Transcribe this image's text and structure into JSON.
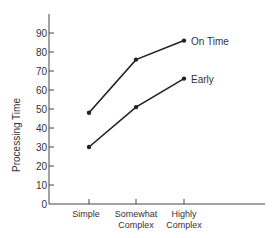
{
  "chart_data": {
    "type": "line",
    "title": "",
    "xlabel": "",
    "ylabel": "Processing Time",
    "categories": [
      "Simple",
      "Somewhat Complex",
      "Highly Complex"
    ],
    "category_lines": [
      [
        "Simple"
      ],
      [
        "Somewhat",
        "Complex"
      ],
      [
        "Highly",
        "Complex"
      ]
    ],
    "series": [
      {
        "name": "On Time",
        "values": [
          48,
          76,
          86
        ]
      },
      {
        "name": "Early",
        "values": [
          30,
          51,
          66
        ]
      }
    ],
    "ylim": [
      0,
      100
    ],
    "yticks": [
      0,
      10,
      20,
      30,
      40,
      50,
      60,
      70,
      80,
      90
    ],
    "grid": false,
    "legend_position": "inline-end-labels",
    "colors": {
      "line": "#222222",
      "axis": "#444444",
      "text": "#333333"
    }
  }
}
